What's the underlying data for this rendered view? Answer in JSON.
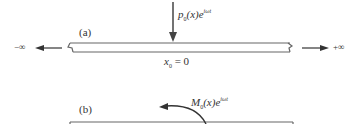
{
  "figure": {
    "panel_a": {
      "label": "(a)",
      "load_label_main": "p",
      "load_label_sub": "0",
      "load_label_arg": "(x)e",
      "load_label_sup": "iωt",
      "left_infinity": "−∞",
      "right_infinity": "+∞",
      "origin_main": "x",
      "origin_sub": "0",
      "origin_rest": "= 0"
    },
    "panel_b": {
      "label": "(b)",
      "moment_label_main": "M",
      "moment_label_sub": "0",
      "moment_label_arg": "(x)e",
      "moment_label_sup": "iωt"
    },
    "colors": {
      "line": "#555555",
      "text": "#333333"
    }
  }
}
